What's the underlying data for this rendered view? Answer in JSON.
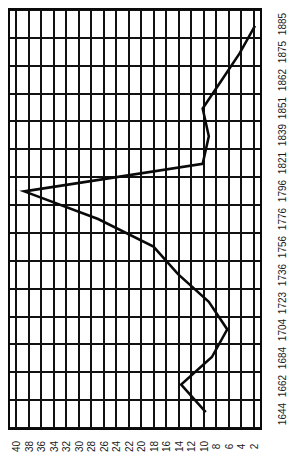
{
  "chart_data": {
    "type": "line",
    "title": "",
    "subtitle": "",
    "orientation": "rotated-90",
    "xlabel": "",
    "ylabel": "",
    "categories": [
      "1644",
      "1662",
      "1684",
      "1704",
      "1723",
      "1736",
      "1756",
      "1776",
      "1796",
      "1821",
      "1839",
      "1851",
      "1862",
      "1875",
      "1885"
    ],
    "category_axis_labels": [
      "1885",
      "1875",
      "1862",
      "1851",
      "1839",
      "1821",
      "1796",
      "1776",
      "1756",
      "1736",
      "1723",
      "1704",
      "1684",
      "1662",
      "1644"
    ],
    "values": [
      9.5,
      13.5,
      8.5,
      6,
      9,
      14,
      18,
      27,
      39,
      10,
      9,
      10,
      7,
      4,
      1.5
    ],
    "series": [
      {
        "name": "series-1",
        "points": [
          {
            "category": "1644",
            "value": 9.5
          },
          {
            "category": "1662",
            "value": 13.5
          },
          {
            "category": "1684",
            "value": 8.5
          },
          {
            "category": "1704",
            "value": 6.0
          },
          {
            "category": "1723",
            "value": 9.0
          },
          {
            "category": "1736",
            "value": 14.0
          },
          {
            "category": "1756",
            "value": 18.0
          },
          {
            "category": "1776",
            "value": 27.0
          },
          {
            "category": "1796",
            "value": 39.0
          },
          {
            "category": "1821",
            "value": 10.0
          },
          {
            "category": "1839",
            "value": 9.0
          },
          {
            "category": "1851",
            "value": 10.0
          },
          {
            "category": "1862",
            "value": 7.0
          },
          {
            "category": "1875",
            "value": 4.0
          },
          {
            "category": "1885",
            "value": 1.5
          }
        ]
      }
    ],
    "value_axis_ticks": [
      "40",
      "38",
      "36",
      "34",
      "32",
      "30",
      "28",
      "26",
      "24",
      "22",
      "20",
      "18",
      "16",
      "14",
      "12",
      "10",
      "8",
      "6",
      "4",
      "2"
    ],
    "value_axis_range": [
      41,
      1
    ],
    "value_axis_direction": "descending-left-to-right",
    "grid": true,
    "legend": "none",
    "line_color": "#0a0a0a",
    "grid_color": "#111111",
    "background_color": "#ffffff"
  }
}
